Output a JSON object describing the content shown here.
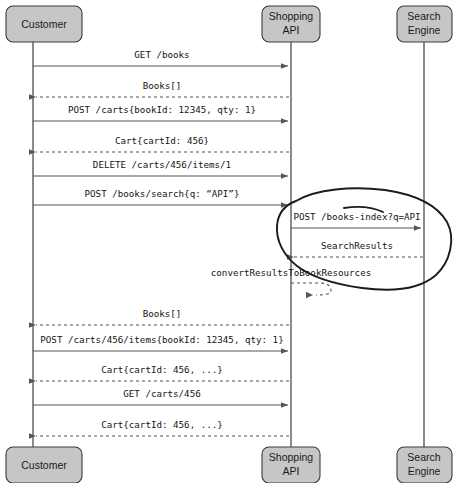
{
  "diagram": {
    "type": "uml-sequence-diagram",
    "background_color": "#ffffff",
    "actor_fill_color": "#c6c6c6",
    "actor_stroke_color": "#3c3c3c",
    "lifeline_color": "#6e6e6e",
    "message_color": "#55555a",
    "annotation_color": "#1b1b1b",
    "participants": [
      {
        "id": "customer",
        "name_line1": "Customer",
        "name_line2": "",
        "x": 33
      },
      {
        "id": "shopping-api",
        "name_line1": "Shopping",
        "name_line2": "API",
        "x": 291
      },
      {
        "id": "search-engine",
        "name_line1": "Search",
        "name_line2": "Engine",
        "x": 424
      }
    ],
    "messages": [
      {
        "index": 1,
        "label": "GET /books",
        "from": "customer",
        "to": "shopping-api",
        "style": "solid",
        "y": 66,
        "label_y": 55
      },
      {
        "index": 2,
        "label": "Books[]",
        "from": "shopping-api",
        "to": "customer",
        "style": "dashed",
        "y": 97,
        "label_y": 86
      },
      {
        "index": 3,
        "label": "POST /carts{bookId: 12345, qty: 1}",
        "from": "customer",
        "to": "shopping-api",
        "style": "solid",
        "y": 121,
        "label_y": 110
      },
      {
        "index": 4,
        "label": "Cart{cartId: 456}",
        "from": "shopping-api",
        "to": "customer",
        "style": "dashed",
        "y": 152,
        "label_y": 141
      },
      {
        "index": 5,
        "label": "DELETE /carts/456/items/1",
        "from": "customer",
        "to": "shopping-api",
        "style": "solid",
        "y": 176,
        "label_y": 165
      },
      {
        "index": 6,
        "label": "POST /books/search{q: “API”}",
        "from": "customer",
        "to": "shopping-api",
        "style": "solid",
        "y": 205,
        "label_y": 194
      },
      {
        "index": 7,
        "label": "POST /books-index?q=API",
        "from": "shopping-api",
        "to": "search-engine",
        "style": "solid",
        "y": 228,
        "label_y": 217
      },
      {
        "index": 8,
        "label": "SearchResults",
        "from": "search-engine",
        "to": "shopping-api",
        "style": "dashed",
        "y": 257,
        "label_y": 246
      },
      {
        "index": 9,
        "label": "convertResultsToBookResources",
        "from": "shopping-api",
        "to": "shopping-api",
        "style": "dashed-self",
        "y": 295,
        "label_y": 273
      },
      {
        "index": 10,
        "label": "Books[]",
        "from": "shopping-api",
        "to": "customer",
        "style": "dashed",
        "y": 325,
        "label_y": 314
      },
      {
        "index": 11,
        "label": "POST /carts/456/items{bookId: 12345, qty: 1}",
        "from": "customer",
        "to": "shopping-api",
        "style": "solid",
        "y": 351,
        "label_y": 340
      },
      {
        "index": 12,
        "label": "Cart{cartId: 456, ...}",
        "from": "shopping-api",
        "to": "customer",
        "style": "dashed",
        "y": 381,
        "label_y": 370
      },
      {
        "index": 13,
        "label": "GET /carts/456",
        "from": "customer",
        "to": "shopping-api",
        "style": "solid",
        "y": 405,
        "label_y": 394
      },
      {
        "index": 14,
        "label": "Cart{cartId: 456, ...}",
        "from": "shopping-api",
        "to": "customer",
        "style": "dashed",
        "y": 436,
        "label_y": 425
      }
    ],
    "annotation": {
      "kind": "hand-drawn-ellipse",
      "encircles": [
        "POST /books-index?q=API",
        "SearchResults"
      ],
      "tick_mark": "short hand-drawn stroke above POST /books-index label"
    },
    "actor_boxes": {
      "top_y": 6,
      "bottom_y": 447,
      "box_height": 36,
      "corner_radius": 7
    }
  }
}
